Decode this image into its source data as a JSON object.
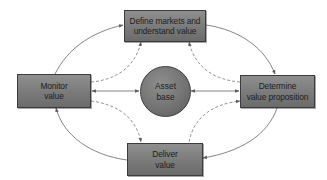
{
  "diagram": {
    "type": "cycle-with-hub",
    "colors": {
      "box_fill": "#7f7f7f",
      "box_border": "#3c3c3c",
      "text": "#1e1e1e",
      "connector": "#777777",
      "background": "#ffffff"
    },
    "hub": {
      "label": "Asset\nbase"
    },
    "nodes": [
      {
        "id": "define",
        "label": "Define markets and\nunderstand value",
        "position": "top"
      },
      {
        "id": "determine",
        "label": "Determine\nvalue proposition",
        "position": "right"
      },
      {
        "id": "deliver",
        "label": "Deliver\nvalue",
        "position": "bottom"
      },
      {
        "id": "monitor",
        "label": "Monitor\nvalue",
        "position": "left"
      }
    ],
    "edges": [
      {
        "from": "monitor",
        "to": "define",
        "style": "solid",
        "shape": "outer-arc"
      },
      {
        "from": "define",
        "to": "determine",
        "style": "solid",
        "shape": "outer-arc"
      },
      {
        "from": "determine",
        "to": "deliver",
        "style": "solid",
        "shape": "outer-arc"
      },
      {
        "from": "deliver",
        "to": "monitor",
        "style": "solid",
        "shape": "outer-arc"
      },
      {
        "from": "monitor",
        "to": "asset_base",
        "style": "solid",
        "shape": "straight",
        "bidirectional": true
      },
      {
        "from": "determine",
        "to": "asset_base",
        "style": "solid",
        "shape": "straight",
        "bidirectional": true
      },
      {
        "from": "monitor",
        "to": "define",
        "style": "dashed",
        "shape": "inner-arc"
      },
      {
        "from": "determine",
        "to": "define",
        "style": "dashed",
        "shape": "inner-arc"
      },
      {
        "from": "monitor",
        "to": "deliver",
        "style": "dashed",
        "shape": "inner-arc"
      },
      {
        "from": "deliver",
        "to": "determine",
        "style": "dashed",
        "shape": "inner-arc"
      }
    ]
  }
}
